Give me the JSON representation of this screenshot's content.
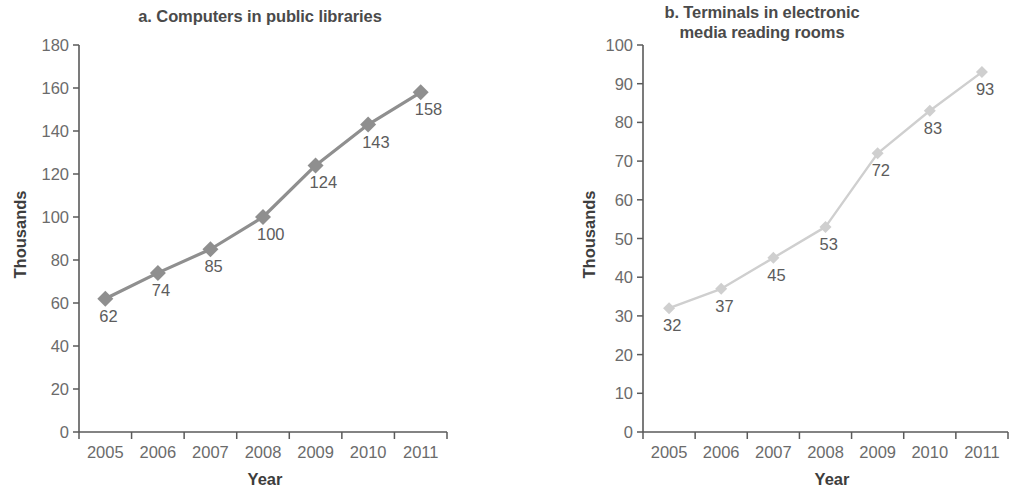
{
  "figure": {
    "background": "#ffffff",
    "width": 1014,
    "height": 498
  },
  "charts": [
    {
      "id": "a",
      "title": "a. Computers in public libraries",
      "xlabel": "Year",
      "ylabel": "Thousands",
      "series_color": "#8f8f8f",
      "axis_color": "#5a5a5a",
      "label_color": "#5c5c5c"
    },
    {
      "id": "b",
      "title_line1": "b. Terminals in electronic",
      "title_line2": "media reading rooms",
      "title": "b. Terminals in electronic media reading rooms",
      "xlabel": "Year",
      "ylabel": "Thousands",
      "series_color": "#cfcfcf",
      "axis_color": "#5a5a5a",
      "label_color": "#5c5c5c"
    }
  ],
  "chart_data": [
    {
      "type": "line",
      "title": "a. Computers in public libraries",
      "xlabel": "Year",
      "ylabel": "Thousands",
      "categories": [
        "2005",
        "2006",
        "2007",
        "2008",
        "2009",
        "2010",
        "2011"
      ],
      "x": [
        2005,
        2006,
        2007,
        2008,
        2009,
        2010,
        2011
      ],
      "values": [
        62,
        74,
        85,
        100,
        124,
        143,
        158
      ],
      "data_labels": [
        "62",
        "74",
        "85",
        "100",
        "124",
        "143",
        "158"
      ],
      "ylim": [
        0,
        180
      ],
      "ytick_step": 20,
      "yticks": [
        0,
        20,
        40,
        60,
        80,
        100,
        120,
        140,
        160,
        180
      ],
      "ytick_labels": [
        "0",
        "20",
        "40",
        "60",
        "80",
        "100",
        "120",
        "140",
        "160",
        "180"
      ],
      "grid": false,
      "legend": false,
      "marker": "diamond",
      "color": "#8f8f8f"
    },
    {
      "type": "line",
      "title": "b. Terminals in electronic media reading rooms",
      "xlabel": "Year",
      "ylabel": "Thousands",
      "categories": [
        "2005",
        "2006",
        "2007",
        "2008",
        "2009",
        "2010",
        "2011"
      ],
      "x": [
        2005,
        2006,
        2007,
        2008,
        2009,
        2010,
        2011
      ],
      "values": [
        32,
        37,
        45,
        53,
        72,
        83,
        93
      ],
      "data_labels": [
        "32",
        "37",
        "45",
        "53",
        "72",
        "83",
        "93"
      ],
      "ylim": [
        0,
        100
      ],
      "ytick_step": 10,
      "yticks": [
        0,
        10,
        20,
        30,
        40,
        50,
        60,
        70,
        80,
        90,
        100
      ],
      "ytick_labels": [
        "0",
        "10",
        "20",
        "30",
        "40",
        "50",
        "60",
        "70",
        "80",
        "90",
        "100"
      ],
      "grid": false,
      "legend": false,
      "marker": "diamond",
      "color": "#cfcfcf"
    }
  ]
}
